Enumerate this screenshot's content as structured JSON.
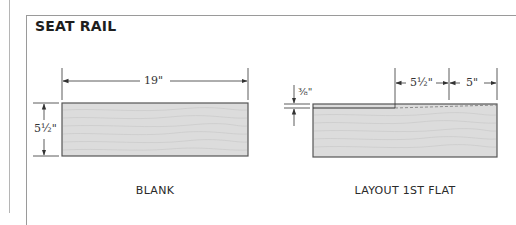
{
  "figure": {
    "title": "SEAT RAIL",
    "colors": {
      "line": "#333333",
      "board_fill": "#dcdcdc",
      "board_edge": "#555555",
      "grain": "#c4c4c4",
      "frame": "#9a9a9a"
    }
  },
  "blank_view": {
    "caption": "BLANK",
    "length_dim": "19\"",
    "width_dim": "5½\""
  },
  "layout_view": {
    "caption": "LAYOUT 1ST FLAT",
    "offset_dim": "⅜\"",
    "segment_1_dim": "5½\"",
    "segment_2_dim": "5\""
  }
}
